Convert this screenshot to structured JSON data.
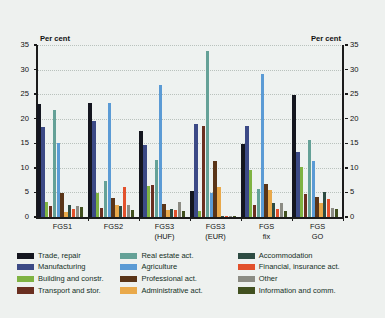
{
  "axes": {
    "unit_left": "Per cent",
    "unit_right": "Per cent",
    "y_ticks": [
      0,
      5,
      10,
      15,
      20,
      25,
      30,
      35
    ]
  },
  "legend": {
    "columns": [
      [
        {
          "label": "Trade, repair",
          "color": "#14161f"
        },
        {
          "label": "Manufacturing",
          "color": "#3c4a86"
        },
        {
          "label": "Building and constr.",
          "color": "#7fb342"
        },
        {
          "label": "Transport and stor.",
          "color": "#6a2f20"
        }
      ],
      [
        {
          "label": "Real estate act.",
          "color": "#64a197"
        },
        {
          "label": "Agriculture",
          "color": "#5b9bd5"
        },
        {
          "label": "Professional act.",
          "color": "#5a3518"
        },
        {
          "label": "Administrative act.",
          "color": "#e9a94a"
        }
      ],
      [
        {
          "label": "Accommodation",
          "color": "#2d4b42"
        },
        {
          "label": "Financial, insurance act.",
          "color": "#e2512c"
        },
        {
          "label": "Other",
          "color": "#8c8c84"
        },
        {
          "label": "Information and comm.",
          "color": "#41501f"
        }
      ]
    ]
  },
  "chart_data": {
    "type": "bar",
    "title": "",
    "xlabel": "",
    "ylabel": "Per cent",
    "ylim": [
      0,
      35
    ],
    "grid": true,
    "legend_position": "bottom",
    "categories": [
      "FGS1",
      "FGS2",
      "FGS3\n(HUF)",
      "FGS3\n(EUR)",
      "FGS\nfix",
      "FGS\nGO"
    ],
    "category_lines": [
      [
        "FGS1",
        ""
      ],
      [
        "FGS2",
        ""
      ],
      [
        "FGS3",
        "(HUF)"
      ],
      [
        "FGS3",
        "(EUR)"
      ],
      [
        "FGS",
        "fix"
      ],
      [
        "FGS",
        "GO"
      ]
    ],
    "series": [
      {
        "name": "Trade, repair",
        "color": "#14161f",
        "values": [
          22.9,
          23.3,
          17.6,
          5.2,
          14.8,
          24.9
        ]
      },
      {
        "name": "Manufacturing",
        "color": "#3c4a86",
        "values": [
          18.4,
          19.5,
          14.6,
          18.9,
          18.5,
          13.3
        ]
      },
      {
        "name": "Building and constr.",
        "color": "#7fb342",
        "values": [
          3.0,
          4.9,
          6.4,
          1.3,
          9.6,
          10.2
        ]
      },
      {
        "name": "Transport and stor.",
        "color": "#6a2f20",
        "values": [
          2.3,
          1.9,
          6.5,
          18.6,
          2.4,
          4.7
        ]
      },
      {
        "name": "Real estate act.",
        "color": "#64a197",
        "values": [
          21.7,
          7.3,
          11.6,
          33.7,
          5.6,
          15.6
        ]
      },
      {
        "name": "Agriculture",
        "color": "#5b9bd5",
        "values": [
          15.1,
          23.2,
          26.9,
          4.9,
          29.1,
          11.4
        ]
      },
      {
        "name": "Professional act.",
        "color": "#5a3518",
        "values": [
          4.9,
          3.9,
          2.7,
          11.3,
          6.8,
          4.1
        ]
      },
      {
        "name": "Administrative act.",
        "color": "#e9a94a",
        "values": [
          1.0,
          2.4,
          1.5,
          6.1,
          5.4,
          2.9
        ]
      },
      {
        "name": "Accommodation",
        "color": "#2d4b42",
        "values": [
          2.4,
          2.2,
          1.6,
          0.3,
          2.8,
          5.0
        ]
      },
      {
        "name": "Financial, insurance act.",
        "color": "#e2512c",
        "values": [
          1.6,
          6.1,
          1.5,
          0.1,
          1.6,
          3.6
        ]
      },
      {
        "name": "Other",
        "color": "#8c8c84",
        "values": [
          2.2,
          2.4,
          3.0,
          0.2,
          2.9,
          1.8
        ]
      },
      {
        "name": "Information and comm.",
        "color": "#41501f",
        "values": [
          2.1,
          1.4,
          1.2,
          0.2,
          1.3,
          1.7
        ]
      }
    ]
  }
}
